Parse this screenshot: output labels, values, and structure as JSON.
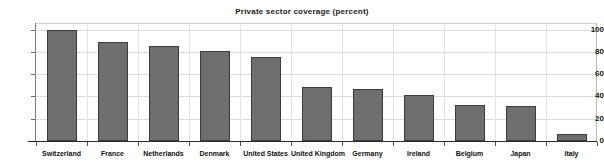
{
  "chart_data": {
    "type": "bar",
    "title": "Private sector coverage (percent)",
    "xlabel": "",
    "ylabel": "",
    "ylim": [
      0,
      105
    ],
    "yticks": [
      0,
      20,
      40,
      60,
      80,
      100
    ],
    "grid": "both",
    "legend": "none",
    "bar_color": "#6e6e6e",
    "bar_edge_color": "#3c3c3c",
    "gridline_color": "#dcdcdc",
    "axis_color": "#2b2b2b",
    "categories": [
      "Switzerland",
      "France",
      "Netherlands",
      "Denmark",
      "United States",
      "United Kingdom",
      "Germany",
      "Ireland",
      "Belgium",
      "Japan",
      "Italy"
    ],
    "values": [
      100,
      89,
      85,
      80.5,
      75.5,
      48.5,
      47,
      41,
      32.5,
      31.5,
      6
    ]
  }
}
